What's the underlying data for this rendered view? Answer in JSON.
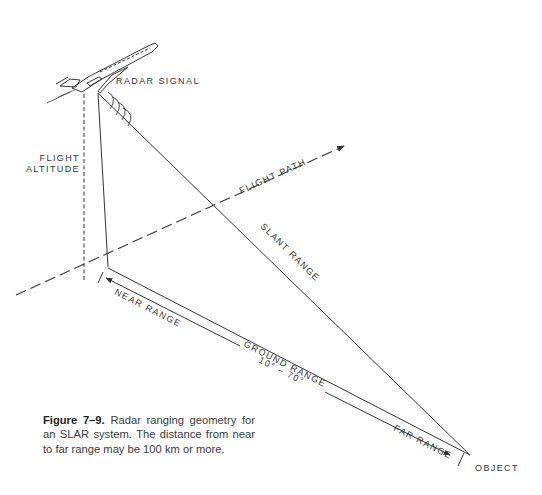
{
  "figure": {
    "labels": {
      "radar_signal": "RADAR SIGNAL",
      "flight_altitude_line1": "FLIGHT",
      "flight_altitude_line2": "ALTITUDE",
      "flight_path": "FLIGHT PATH",
      "slant_range": "SLANT RANGE",
      "near_range": "NEAR RANGE",
      "ground_range": "GROUND RANGE",
      "depression_angle": "10° – 70°",
      "far_range": "FAR RANGE",
      "object": "OBJECT"
    },
    "colors": {
      "line": "#333333",
      "text": "#333333",
      "background": "#ffffff"
    }
  },
  "caption": {
    "number": "Figure 7–9.",
    "text": " Radar ranging geometry for an SLAR system. The distance from near to far range may be 100 km or more."
  }
}
